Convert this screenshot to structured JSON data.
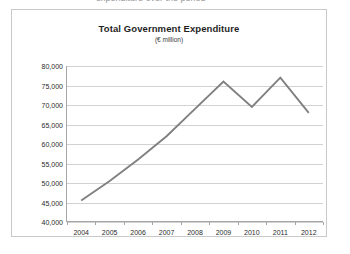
{
  "top_clip_text": "expenditure over the period",
  "chart_data": {
    "type": "line",
    "title": "Total Government Expenditure",
    "subtitle": "(€ million)",
    "xlabel": "",
    "ylabel": "",
    "categories": [
      "2004",
      "2005",
      "2006",
      "2007",
      "2008",
      "2009",
      "2010",
      "2011",
      "2012"
    ],
    "x": [
      2004,
      2005,
      2006,
      2007,
      2008,
      2009,
      2010,
      2011,
      2012
    ],
    "values": [
      45500,
      50500,
      56000,
      62000,
      69000,
      76000,
      69500,
      77000,
      68000
    ],
    "series": [
      {
        "name": "Total Government Expenditure",
        "values": [
          45500,
          50500,
          56000,
          62000,
          69000,
          76000,
          69500,
          77000,
          68000
        ]
      }
    ],
    "ylim": [
      40000,
      80000
    ],
    "ytick_values": [
      40000,
      45000,
      50000,
      55000,
      60000,
      65000,
      70000,
      75000,
      80000
    ],
    "ytick_labels": [
      "40,000",
      "45,000",
      "50,000",
      "55,000",
      "60,000",
      "65,000",
      "70,000",
      "75,000",
      "80,000"
    ],
    "grid": true,
    "legend": false,
    "legend_position": "none",
    "line_color": "#808080",
    "grid_color": "#d2d2d2",
    "axis_color": "#a6a6a6",
    "plot_background": "#ffffff"
  }
}
